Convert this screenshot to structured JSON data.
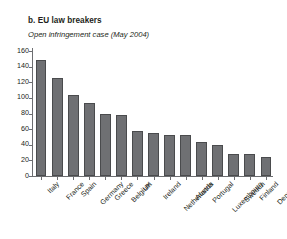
{
  "figure": {
    "title": "b. EU law breakers",
    "subtitle": "Open infringement case (May 2004)"
  },
  "colors": {
    "bar_fill": "#6f7073",
    "bar_edge": "#4a4b4d",
    "axis": "#6d6e71",
    "text": "#231f20",
    "background": "#ffffff"
  },
  "chart_data": {
    "type": "bar",
    "title": "b. EU law breakers",
    "subtitle": "Open infringement case (May 2004)",
    "xlabel": "",
    "ylabel": "",
    "ylim": [
      0,
      160
    ],
    "yticks": [
      0,
      20,
      40,
      60,
      80,
      100,
      120,
      140,
      160
    ],
    "ytick_labels": [
      "0",
      "20",
      "40",
      "60",
      "80",
      "100",
      "120",
      "140",
      "160"
    ],
    "grid": false,
    "legend": null,
    "categories": [
      "Italy",
      "France",
      "Spain",
      "Germany",
      "Greece",
      "Belgium",
      "UK",
      "Ireland",
      "Netherlands",
      "Austria",
      "Portugal",
      "Luxembourg",
      "Sweden",
      "Finland",
      "Denmark"
    ],
    "values": [
      149,
      125,
      104,
      93,
      79,
      78,
      58,
      55,
      53,
      52,
      44,
      40,
      28,
      28,
      24
    ]
  }
}
